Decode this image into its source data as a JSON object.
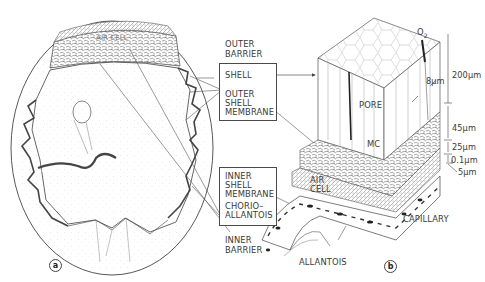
{
  "figure": {
    "panels": [
      {
        "id": "a",
        "label": "a",
        "subject": "whole egg cross-section"
      },
      {
        "id": "b",
        "label": "b",
        "subject": "block section of shell and membranes"
      }
    ],
    "panel_a": {
      "air_cell_label": "AIR CELL"
    },
    "outer_barrier": {
      "heading_line1": "OUTER",
      "heading_line2": "BARRIER",
      "items": [
        {
          "label": "SHELL"
        },
        {
          "label_line1": "OUTER",
          "label_line2": "SHELL",
          "label_line3": "MEMBRANE"
        }
      ]
    },
    "inner_barrier": {
      "heading_line1": "INNER",
      "heading_line2": "BARRIER",
      "items": [
        {
          "label_line1": "INNER",
          "label_line2": "SHELL",
          "label_line3": "MEMBRANE"
        },
        {
          "label_line1": "CHORIO–",
          "label_line2": "ALLANTOIS"
        }
      ]
    },
    "panel_b": {
      "gas_label": "O",
      "gas_subscript": "2",
      "pore_label": "PORE",
      "mc_label": "MC",
      "air_cell_line1": "AIR",
      "air_cell_line2": "CELL",
      "capillary_label": "CAPILLARY",
      "allantois_label": "ALLANTOIS",
      "pore_width": "8µm",
      "thickness_scale": [
        {
          "layer": "shell",
          "value": "200µm"
        },
        {
          "layer": "outer shell membrane",
          "value": "45µm"
        },
        {
          "layer": "inner shell membrane",
          "value": "25µm"
        },
        {
          "layer": "limiting membrane",
          "value": "0.1µm"
        },
        {
          "layer": "chorioallantois",
          "value": "5µm"
        }
      ]
    }
  },
  "colors": {
    "ink": "#3a3a3a",
    "background": "#ffffff",
    "stipple": "#9a9a9a"
  }
}
